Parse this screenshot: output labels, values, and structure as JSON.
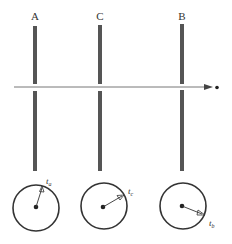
{
  "plates": [
    {
      "label": "A",
      "x": 35
    },
    {
      "label": "C",
      "x": 100
    },
    {
      "label": "B",
      "x": 182
    }
  ],
  "beam": {
    "y": 87,
    "x_start": 14,
    "x_end": 213,
    "particle_x": 217
  },
  "clocks": [
    {
      "name": "clock-a",
      "label": "t",
      "subscript": "a",
      "cx": 36,
      "cy": 221,
      "r": 24
    },
    {
      "name": "clock-c",
      "label": "t",
      "subscript": "c",
      "cx": 104,
      "cy": 221,
      "r": 24
    },
    {
      "name": "clock-b",
      "label": "t",
      "subscript": "b",
      "cx": 182,
      "cy": 221,
      "r": 24
    }
  ],
  "colors": {
    "ink": "#333333",
    "bar": "#555555",
    "arrow": "#777777"
  }
}
